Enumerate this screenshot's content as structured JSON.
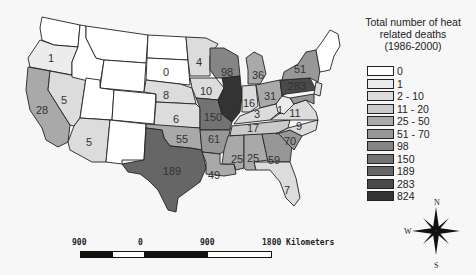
{
  "legend": {
    "title_lines": [
      "Total number of heat",
      "related deaths",
      "(1986-2000)"
    ],
    "items": [
      {
        "label": "0",
        "color": "#ffffff"
      },
      {
        "label": "1",
        "color": "#ececec"
      },
      {
        "label": "2 - 10",
        "color": "#dcdcdc"
      },
      {
        "label": "11 - 20",
        "color": "#cacaca"
      },
      {
        "label": "25 - 50",
        "color": "#a9a9a9"
      },
      {
        "label": "51 - 70",
        "color": "#979797"
      },
      {
        "label": "98",
        "color": "#858585"
      },
      {
        "label": "150",
        "color": "#737373"
      },
      {
        "label": "189",
        "color": "#666666"
      },
      {
        "label": "283",
        "color": "#4a4a4a"
      },
      {
        "label": "824",
        "color": "#333333"
      }
    ]
  },
  "states": [
    {
      "name": "Washington",
      "value": null
    },
    {
      "name": "Oregon",
      "value": 1
    },
    {
      "name": "California",
      "value": 28
    },
    {
      "name": "Nevada",
      "value": 5
    },
    {
      "name": "Arizona",
      "value": 5
    },
    {
      "name": "Idaho",
      "value": 0
    },
    {
      "name": "Montana",
      "value": 0
    },
    {
      "name": "Wyoming",
      "value": 0
    },
    {
      "name": "Utah",
      "value": 0
    },
    {
      "name": "Colorado",
      "value": 0
    },
    {
      "name": "New Mexico",
      "value": 0
    },
    {
      "name": "North Dakota",
      "value": 0
    },
    {
      "name": "South Dakota",
      "value": 0
    },
    {
      "name": "Nebraska",
      "value": 8
    },
    {
      "name": "Kansas",
      "value": 6
    },
    {
      "name": "Oklahoma",
      "value": 55
    },
    {
      "name": "Texas",
      "value": 189
    },
    {
      "name": "Minnesota",
      "value": 4
    },
    {
      "name": "Iowa",
      "value": 10
    },
    {
      "name": "Missouri",
      "value": 150
    },
    {
      "name": "Arkansas",
      "value": 61
    },
    {
      "name": "Louisiana",
      "value": 49
    },
    {
      "name": "Wisconsin",
      "value": 98
    },
    {
      "name": "Illinois",
      "value": 824
    },
    {
      "name": "Michigan",
      "value": 36
    },
    {
      "name": "Indiana",
      "value": 16
    },
    {
      "name": "Ohio",
      "value": 31
    },
    {
      "name": "Kentucky",
      "value": 3
    },
    {
      "name": "Tennessee",
      "value": 17
    },
    {
      "name": "Mississippi",
      "value": 25
    },
    {
      "name": "Alabama",
      "value": 25
    },
    {
      "name": "Georgia",
      "value": 59
    },
    {
      "name": "Florida",
      "value": 7
    },
    {
      "name": "South Carolina",
      "value": 70
    },
    {
      "name": "North Carolina",
      "value": 9
    },
    {
      "name": "Virginia",
      "value": 11
    },
    {
      "name": "West Virginia",
      "value": 1
    },
    {
      "name": "Pennsylvania",
      "value": 283
    },
    {
      "name": "New York",
      "value": 51
    }
  ],
  "labels": {
    "OR": "1",
    "CA": "28",
    "NV": "5",
    "AZ": "5",
    "SD": "0",
    "NE": "8",
    "KS": "6",
    "OK": "55",
    "TX": "189",
    "MN": "4",
    "IA": "10",
    "MO": "150",
    "AR": "61",
    "LA": "49",
    "WI": "98",
    "IL": "824",
    "MI": "36",
    "IN": "16",
    "OH": "31",
    "KY": "3",
    "TN": "17",
    "MS": "25",
    "AL": "25",
    "GA": "59",
    "FL": "7",
    "SC": "70",
    "NC": "9",
    "VA": "11",
    "WV": "1",
    "PA": "283",
    "NY": "51"
  },
  "scale": {
    "ticks": [
      "900",
      "0",
      "900",
      "1800 Kilometers"
    ]
  },
  "compass": {
    "n": "N",
    "s": "S",
    "w": "W"
  }
}
